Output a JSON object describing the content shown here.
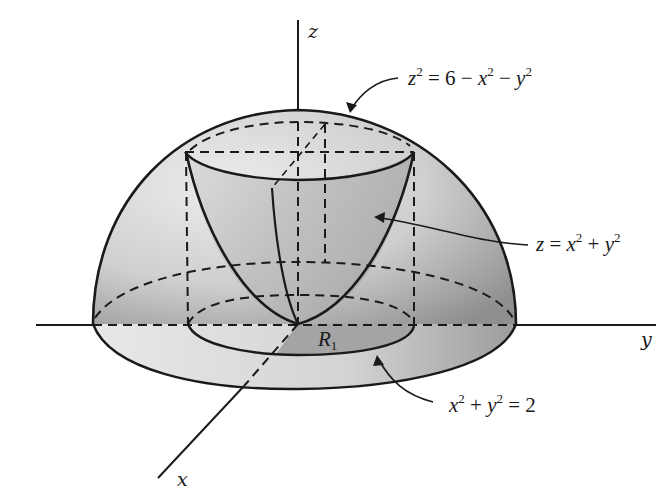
{
  "figure": {
    "axes": {
      "x_label": "x",
      "y_label": "y",
      "z_label": "z"
    },
    "surfaces": {
      "sphere": {
        "lhs_var": "z",
        "lhs_exp": "2",
        "rhs_const": "6",
        "rhs_term1_var": "x",
        "rhs_term1_exp": "2",
        "rhs_term2_var": "y",
        "rhs_term2_exp": "2",
        "text": "z² = 6 − x² − y²"
      },
      "paraboloid": {
        "lhs_var": "z",
        "rhs_term1_var": "x",
        "rhs_term1_exp": "2",
        "rhs_term2_var": "y",
        "rhs_term2_exp": "2",
        "text": "z = x² + y²"
      },
      "circle": {
        "term1_var": "x",
        "term1_exp": "2",
        "term2_var": "y",
        "term2_exp": "2",
        "rhs_const": "2",
        "text": "x² + y² = 2"
      }
    },
    "region": {
      "label_var": "R",
      "label_sub": "1"
    },
    "colors": {
      "stroke": "#1a1a1a",
      "dome_fill_light": "#e9e9e9",
      "dome_fill_dark": "#9a9a9a",
      "region_fill": "#a8a8a8",
      "paraboloid_fill": "#c4c4c4"
    }
  }
}
